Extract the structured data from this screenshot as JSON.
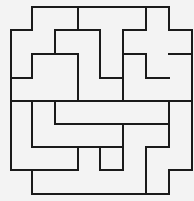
{
  "diagram": {
    "title": "",
    "type": "polyomino-tiling",
    "width": 194,
    "height": 201,
    "stroke_color": "#1a1a1a",
    "background_color": "#f3f3f3",
    "segments": [
      [
        32,
        7,
        169,
        7
      ],
      [
        11,
        30,
        32,
        30
      ],
      [
        55,
        30,
        100,
        30
      ],
      [
        123,
        30,
        146,
        30
      ],
      [
        169,
        30,
        192,
        30
      ],
      [
        32,
        54,
        78,
        54
      ],
      [
        123,
        54,
        146,
        54
      ],
      [
        169,
        54,
        192,
        54
      ],
      [
        11,
        78,
        32,
        78
      ],
      [
        100,
        78,
        123,
        78
      ],
      [
        146,
        78,
        169,
        78
      ],
      [
        11,
        101,
        192,
        101
      ],
      [
        55,
        124,
        169,
        124
      ],
      [
        32,
        147,
        123,
        147
      ],
      [
        146,
        147,
        169,
        147
      ],
      [
        11,
        170,
        78,
        170
      ],
      [
        100,
        170,
        123,
        170
      ],
      [
        169,
        170,
        192,
        170
      ],
      [
        32,
        194,
        169,
        194
      ],
      [
        11,
        30,
        11,
        170
      ],
      [
        32,
        7,
        32,
        30
      ],
      [
        32,
        54,
        32,
        78
      ],
      [
        32,
        101,
        32,
        147
      ],
      [
        32,
        170,
        32,
        194
      ],
      [
        55,
        30,
        55,
        54
      ],
      [
        55,
        101,
        55,
        124
      ],
      [
        78,
        7,
        78,
        30
      ],
      [
        78,
        54,
        78,
        101
      ],
      [
        78,
        147,
        78,
        170
      ],
      [
        100,
        30,
        100,
        78
      ],
      [
        100,
        147,
        100,
        170
      ],
      [
        123,
        30,
        123,
        101
      ],
      [
        123,
        124,
        123,
        170
      ],
      [
        146,
        7,
        146,
        30
      ],
      [
        146,
        54,
        146,
        78
      ],
      [
        146,
        147,
        146,
        194
      ],
      [
        169,
        7,
        169,
        30
      ],
      [
        169,
        101,
        169,
        147
      ],
      [
        169,
        170,
        169,
        194
      ],
      [
        192,
        30,
        192,
        170
      ]
    ]
  }
}
